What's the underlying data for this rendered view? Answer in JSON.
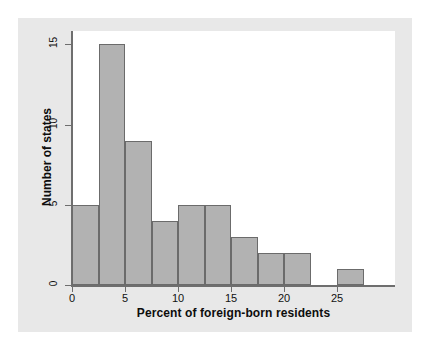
{
  "chart_data": {
    "type": "bar",
    "title": "",
    "subtitle": "",
    "xlabel": "Percent of foreign-born residents",
    "ylabel": "Number of states",
    "xlim": [
      -1.5,
      29
    ],
    "ylim": [
      0,
      16.2
    ],
    "grid": false,
    "legend": null,
    "bin_width": 2.5,
    "bin_edges": [
      0,
      2.5,
      5,
      7.5,
      10,
      12.5,
      15,
      17.5,
      20,
      22.5,
      25,
      27.5
    ],
    "categories": [
      "0-2.5",
      "2.5-5",
      "5-7.5",
      "7.5-10",
      "10-12.5",
      "12.5-15",
      "15-17.5",
      "17.5-20",
      "20-22.5",
      "22.5-25",
      "25-27.5"
    ],
    "values": [
      5,
      15,
      9,
      4,
      5,
      5,
      3,
      2,
      2,
      0,
      1
    ],
    "bars": [
      {
        "x0": 0,
        "x1": 2.5,
        "value": 5
      },
      {
        "x0": 2.5,
        "x1": 5,
        "value": 15
      },
      {
        "x0": 5,
        "x1": 7.5,
        "value": 9
      },
      {
        "x0": 7.5,
        "x1": 10,
        "value": 4
      },
      {
        "x0": 10,
        "x1": 12.5,
        "value": 5
      },
      {
        "x0": 12.5,
        "x1": 15,
        "value": 5
      },
      {
        "x0": 15,
        "x1": 17.5,
        "value": 3
      },
      {
        "x0": 17.5,
        "x1": 20,
        "value": 2
      },
      {
        "x0": 20,
        "x1": 22.5,
        "value": 2
      },
      {
        "x0": 22.5,
        "x1": 25,
        "value": 0
      },
      {
        "x0": 25,
        "x1": 27.5,
        "value": 1
      }
    ],
    "xticks": [
      0,
      5,
      10,
      15,
      20,
      25
    ],
    "xtick_labels": [
      "0",
      "5",
      "10",
      "15",
      "20",
      "25"
    ],
    "yticks": [
      0,
      5,
      10,
      15
    ],
    "ytick_labels": [
      "0",
      "5",
      "10",
      "15"
    ],
    "colors": {
      "bar_fill": "#b2b2b2",
      "bar_border": "#6b6b6b",
      "axis": "#6e6e6e",
      "text": "#0d0d0d",
      "plot_background": "#ffffff",
      "panel_background": "#e8e8e8",
      "page_background": "#ffffff"
    }
  }
}
